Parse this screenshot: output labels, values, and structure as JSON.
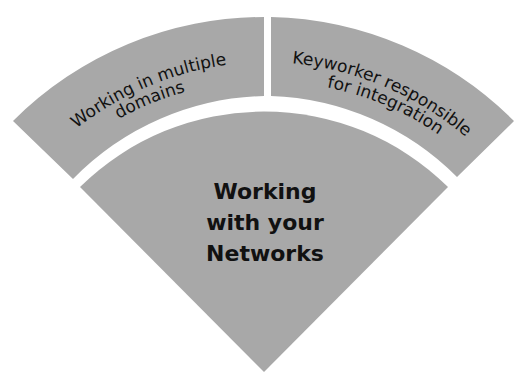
{
  "diagram": {
    "type": "fan-diagram",
    "colors": {
      "segment_fill": "#a8a8a8",
      "text": "#111111",
      "background": "#ffffff"
    },
    "center": {
      "lines": [
        "Working",
        "with your",
        "Networks"
      ]
    },
    "outer_segments": [
      {
        "position": "left",
        "lines": [
          "Working in multiple",
          "domains"
        ]
      },
      {
        "position": "right",
        "lines": [
          "Keyworker responsible",
          "for integration"
        ]
      }
    ]
  }
}
